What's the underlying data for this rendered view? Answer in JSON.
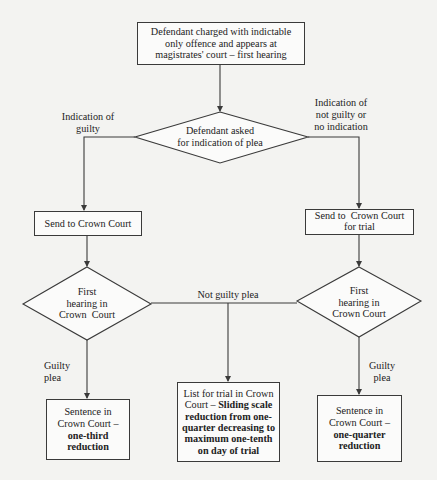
{
  "diagram": {
    "type": "flowchart",
    "colors": {
      "line": "#3a3a3a",
      "background": "#f3f3f1",
      "box_fill": "#fbfbfa"
    },
    "nodes": {
      "start": {
        "shape": "rectangle",
        "line1": "Defendant charged with indictable",
        "line2": "only offence and appears at",
        "line3": "magistrates' court – first hearing"
      },
      "plea_decision": {
        "shape": "diamond",
        "line1": "Defendant asked",
        "line2": "for indication of plea"
      },
      "send_left": {
        "shape": "rectangle",
        "line1": "Send to Crown Court"
      },
      "send_right": {
        "shape": "rectangle",
        "line1": "Send to  Crown Court",
        "line2": "for trial"
      },
      "hearing_left": {
        "shape": "diamond",
        "line1": "First",
        "line2": "hearing in",
        "line3": "Crown  Court"
      },
      "hearing_right": {
        "shape": "diamond",
        "line1": "First",
        "line2": "hearing in",
        "line3": "Crown Court"
      },
      "sentence_left": {
        "shape": "rectangle",
        "line1": "Sentence in",
        "line2": "Crown Court –",
        "bold1": "one-third",
        "bold2": "reduction"
      },
      "trial_list": {
        "shape": "rectangle",
        "line1": "List for trial in Crown",
        "line2_plain": "Court – ",
        "line2_bold": "Sliding scale",
        "bold1": "reduction from one-",
        "bold2": "quarter decreasing to",
        "bold3": "maximum one-tenth",
        "bold4": "on day of trial"
      },
      "sentence_right": {
        "shape": "rectangle",
        "line1": "Sentence in",
        "line2": "Crown Court –",
        "bold1": "one-quarter",
        "bold2": "reduction"
      }
    },
    "edge_labels": {
      "indication_guilty": {
        "line1": "Indication of",
        "line2": "guilty"
      },
      "indication_not_guilty": {
        "line1": "Indication of",
        "line2": "not guilty or",
        "line3": "no indication"
      },
      "not_guilty_plea": "Not guilty plea",
      "guilty_plea_left": {
        "line1": "Guilty",
        "line2": "plea"
      },
      "guilty_plea_right": {
        "line1": "Guilty",
        "line2": "plea"
      }
    },
    "edges": [
      {
        "from": "start",
        "to": "plea_decision"
      },
      {
        "from": "plea_decision",
        "to": "send_left",
        "label": "indication_guilty"
      },
      {
        "from": "plea_decision",
        "to": "send_right",
        "label": "indication_not_guilty"
      },
      {
        "from": "send_left",
        "to": "hearing_left"
      },
      {
        "from": "send_right",
        "to": "hearing_right"
      },
      {
        "from": "hearing_left",
        "to": "trial_list",
        "label": "not_guilty_plea"
      },
      {
        "from": "hearing_right",
        "to": "trial_list",
        "label": "not_guilty_plea"
      },
      {
        "from": "hearing_left",
        "to": "sentence_left",
        "label": "guilty_plea_left"
      },
      {
        "from": "hearing_right",
        "to": "sentence_right",
        "label": "guilty_plea_right"
      }
    ]
  }
}
